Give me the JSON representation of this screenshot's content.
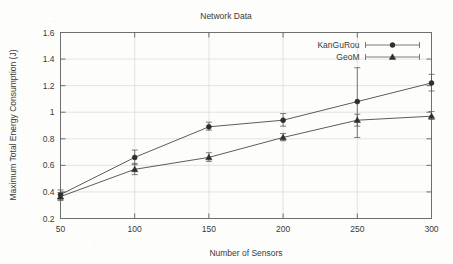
{
  "chart_data": {
    "type": "line",
    "title": "Network Data",
    "xlabel": "Number of Sensors",
    "ylabel": "Maximum Total Energy Consumption (J)",
    "x": [
      50,
      100,
      150,
      200,
      250,
      300
    ],
    "xlim": [
      50,
      300
    ],
    "ylim": [
      0.2,
      1.6
    ],
    "xticks": [
      "50",
      "100",
      "150",
      "200",
      "250",
      "300"
    ],
    "yticks": [
      "0.2",
      "0.4",
      "0.6",
      "0.8",
      "1",
      "1.2",
      "1.4",
      "1.6"
    ],
    "grid": true,
    "legend_position": "top-right",
    "series": [
      {
        "name": "KanGuRou",
        "marker": "filled-circle",
        "values": [
          0.38,
          0.66,
          0.89,
          0.94,
          1.08,
          1.22
        ],
        "err_low": [
          0.345,
          0.605,
          0.865,
          0.895,
          0.81,
          1.16
        ],
        "err_high": [
          0.415,
          0.715,
          0.925,
          0.99,
          1.335,
          1.285
        ]
      },
      {
        "name": "GeoM",
        "marker": "filled-triangle",
        "values": [
          0.365,
          0.57,
          0.66,
          0.81,
          0.94,
          0.97
        ],
        "err_low": [
          0.335,
          0.53,
          0.63,
          0.785,
          0.895,
          0.945
        ],
        "err_high": [
          0.395,
          0.615,
          0.695,
          0.84,
          0.985,
          1.005
        ]
      }
    ]
  },
  "legend": {
    "items": [
      {
        "label": "KanGuRou"
      },
      {
        "label": "GeoM"
      }
    ]
  }
}
